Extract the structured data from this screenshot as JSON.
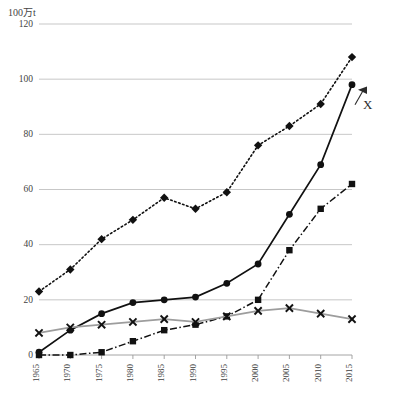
{
  "chart_data": {
    "type": "line",
    "title": "",
    "subtitle": "",
    "unit_label": "100万t",
    "xlabel": "",
    "ylabel": "",
    "xlim": [
      1965,
      2015
    ],
    "ylim": [
      0,
      120
    ],
    "ytick_step": 20,
    "grid": true,
    "legend_position": "none",
    "categories": [
      1965,
      1970,
      1975,
      1980,
      1985,
      1990,
      1995,
      2000,
      2005,
      2010,
      2015
    ],
    "x": [
      "1965",
      "1970",
      "1975",
      "1980",
      "1985",
      "1990",
      "1995",
      "2000",
      "2005",
      "2010",
      "2015"
    ],
    "yticks": [
      "0",
      "20",
      "40",
      "60",
      "80",
      "100",
      "120"
    ],
    "series": [
      {
        "name": "series-dotted-diamond",
        "marker": "diamond",
        "line_style": "dotted",
        "color": "#111111",
        "values": [
          23,
          31,
          42,
          49,
          57,
          53,
          59,
          76,
          83,
          91,
          108
        ]
      },
      {
        "name": "series-solid-circle",
        "marker": "circle",
        "line_style": "solid",
        "color": "#111111",
        "values": [
          1,
          9,
          15,
          19,
          20,
          21,
          26,
          33,
          51,
          69,
          98
        ]
      },
      {
        "name": "series-dashdot-square",
        "marker": "square",
        "line_style": "dash-dot",
        "color": "#111111",
        "values": [
          0,
          0,
          1,
          5,
          9,
          11,
          14,
          20,
          38,
          53,
          62
        ]
      },
      {
        "name": "series-solid-x",
        "marker": "x",
        "line_style": "solid",
        "color": "#9d9d9d",
        "values": [
          8,
          10,
          11,
          12,
          13,
          12,
          14,
          16,
          17,
          15,
          13
        ]
      }
    ],
    "annotations": [
      {
        "text": "X",
        "target_series": "series-solid-circle",
        "target_x": "2015",
        "target_y": 98,
        "arrow": "left"
      }
    ]
  }
}
